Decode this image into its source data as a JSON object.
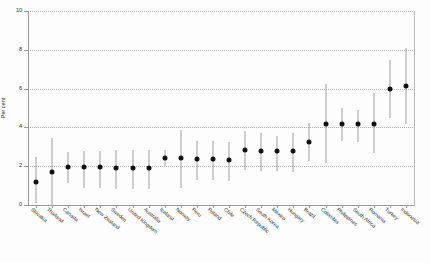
{
  "chart_data": {
    "type": "scatter",
    "title": "",
    "xlabel": "",
    "ylabel": "Per cent",
    "ylim": [
      0,
      10
    ],
    "yticks": [
      0,
      2,
      4,
      6,
      8,
      10
    ],
    "grid": "horizontal-dotted",
    "legend": "none",
    "marker": "filled-circle-with-error-bars",
    "categories": [
      "Slovakia",
      "Thailand",
      "Canada",
      "Israel",
      "New Zealand",
      "Sweden",
      "United Kingdom",
      "Australia",
      "Iceland",
      "Norway",
      "Peru",
      "Poland",
      "Chile",
      "Czech Republic",
      "South Korea",
      "Mexico",
      "Hungary",
      "Brazil",
      "Colombia",
      "Philippines",
      "South Africa",
      "Romania",
      "Turkey",
      "Indonesia"
    ],
    "values": [
      1.2,
      1.7,
      1.95,
      1.95,
      1.95,
      1.9,
      1.9,
      1.9,
      2.4,
      2.4,
      2.35,
      2.35,
      2.3,
      2.85,
      2.8,
      2.8,
      2.8,
      3.25,
      4.2,
      4.2,
      4.15,
      4.15,
      6.0,
      6.15
    ],
    "lower": [
      0.1,
      0.0,
      1.15,
      0.9,
      0.9,
      0.85,
      0.85,
      0.85,
      2.0,
      0.85,
      1.3,
      1.3,
      1.25,
      1.8,
      1.75,
      1.75,
      1.7,
      2.25,
      2.15,
      3.3,
      3.25,
      2.7,
      4.5,
      4.2
    ],
    "upper": [
      2.45,
      3.45,
      2.75,
      2.8,
      2.8,
      2.85,
      2.85,
      2.85,
      2.85,
      3.85,
      3.3,
      3.3,
      3.25,
      3.8,
      3.7,
      3.55,
      3.7,
      4.25,
      6.25,
      5.0,
      4.9,
      5.75,
      7.5,
      8.1
    ],
    "series": [
      {
        "name": "Estimate with 95% confidence interval",
        "points": [
          {
            "category": "Slovakia",
            "value": 1.2,
            "lower": 0.1,
            "upper": 2.45
          },
          {
            "category": "Thailand",
            "value": 1.7,
            "lower": 0.0,
            "upper": 3.45
          },
          {
            "category": "Canada",
            "value": 1.95,
            "lower": 1.15,
            "upper": 2.75
          },
          {
            "category": "Israel",
            "value": 1.95,
            "lower": 0.9,
            "upper": 2.8
          },
          {
            "category": "New Zealand",
            "value": 1.95,
            "lower": 0.9,
            "upper": 2.8
          },
          {
            "category": "Sweden",
            "value": 1.9,
            "lower": 0.85,
            "upper": 2.85
          },
          {
            "category": "United Kingdom",
            "value": 1.9,
            "lower": 0.85,
            "upper": 2.85
          },
          {
            "category": "Australia",
            "value": 1.9,
            "lower": 0.85,
            "upper": 2.85
          },
          {
            "category": "Iceland",
            "value": 2.4,
            "lower": 2.0,
            "upper": 2.85
          },
          {
            "category": "Norway",
            "value": 2.4,
            "lower": 0.85,
            "upper": 3.85
          },
          {
            "category": "Peru",
            "value": 2.35,
            "lower": 1.3,
            "upper": 3.3
          },
          {
            "category": "Poland",
            "value": 2.35,
            "lower": 1.3,
            "upper": 3.3
          },
          {
            "category": "Chile",
            "value": 2.3,
            "lower": 1.25,
            "upper": 3.25
          },
          {
            "category": "Czech Republic",
            "value": 2.85,
            "lower": 1.8,
            "upper": 3.8
          },
          {
            "category": "South Korea",
            "value": 2.8,
            "lower": 1.75,
            "upper": 3.7
          },
          {
            "category": "Mexico",
            "value": 2.8,
            "lower": 1.75,
            "upper": 3.55
          },
          {
            "category": "Hungary",
            "value": 2.8,
            "lower": 1.7,
            "upper": 3.7
          },
          {
            "category": "Brazil",
            "value": 3.25,
            "lower": 2.25,
            "upper": 4.25
          },
          {
            "category": "Colombia",
            "value": 4.2,
            "lower": 2.15,
            "upper": 6.25
          },
          {
            "category": "Philippines",
            "value": 4.2,
            "lower": 3.3,
            "upper": 5.0
          },
          {
            "category": "South Africa",
            "value": 4.15,
            "lower": 3.25,
            "upper": 4.9
          },
          {
            "category": "Romania",
            "value": 4.15,
            "lower": 2.7,
            "upper": 5.75
          },
          {
            "category": "Turkey",
            "value": 6.0,
            "lower": 4.5,
            "upper": 7.5
          },
          {
            "category": "Indonesia",
            "value": 6.15,
            "lower": 4.2,
            "upper": 8.1
          }
        ]
      }
    ],
    "colors": {
      "marker": "#111111",
      "errorbar": "#9e9e9e",
      "gridline": "#b0b0b0",
      "axis": "#9a9a9a",
      "background": "#fdfdfd"
    }
  }
}
